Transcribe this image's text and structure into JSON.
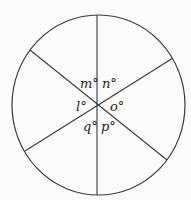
{
  "diagram": {
    "type": "circle-with-three-diameters",
    "labels": {
      "m": "m°",
      "n": "n°",
      "l": "l°",
      "o": "o°",
      "q": "q°",
      "p": "p°"
    },
    "colors": {
      "stroke": "#3a3a3a",
      "text": "#222222",
      "background": "#fbfbfa"
    }
  }
}
